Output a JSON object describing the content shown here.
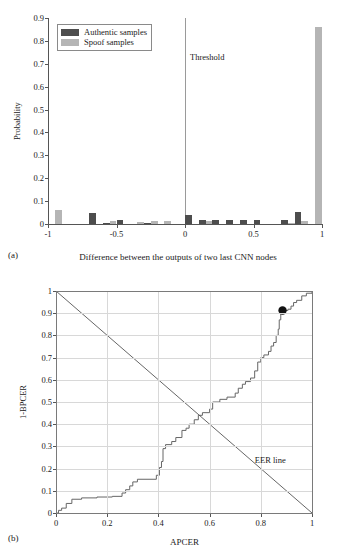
{
  "figure": {
    "panel_a_caption": "(a)",
    "panel_b_caption": "(b)"
  },
  "chart_data": [
    {
      "id": "panel-a",
      "type": "bar",
      "title": "",
      "xlabel": "Difference between the outputs of two last CNN nodes",
      "ylabel": "Probability",
      "xlim": [
        -1,
        1
      ],
      "ylim": [
        0,
        0.9
      ],
      "grid": false,
      "legend_position": "upper-left",
      "xticks": [
        "-1",
        "-0.5",
        "0",
        "0.5",
        "1"
      ],
      "xtick_values": [
        -1,
        -0.5,
        0,
        0.5,
        1
      ],
      "yticks": [
        "0",
        "0.1",
        "0.2",
        "0.3",
        "0.4",
        "0.5",
        "0.6",
        "0.7",
        "0.8",
        "0.9"
      ],
      "ytick_values": [
        0,
        0.1,
        0.2,
        0.3,
        0.4,
        0.5,
        0.6,
        0.7,
        0.8,
        0.9
      ],
      "bin_edges": [
        -1,
        -0.9,
        -0.8,
        -0.7,
        -0.6,
        -0.5,
        -0.4,
        -0.3,
        -0.2,
        -0.1,
        0,
        0.1,
        0.2,
        0.3,
        0.4,
        0.5,
        0.6,
        0.7,
        0.8,
        0.9,
        1
      ],
      "series": [
        {
          "name": "Authentic samples",
          "color": "#4d4d4d",
          "values": [
            0.0,
            0.0,
            0.0,
            0.05,
            0.005,
            0.018,
            0.0,
            0.004,
            0.0,
            0.0,
            0.038,
            0.018,
            0.016,
            0.016,
            0.016,
            0.016,
            0.0,
            0.018,
            0.052,
            0.0
          ]
        },
        {
          "name": "Spoof samples",
          "color": "#b5b5b5",
          "values": [
            0.061,
            0.0,
            0.0,
            0.0,
            0.012,
            0.0,
            0.008,
            0.011,
            0.012,
            0.0,
            0.0,
            0.012,
            0.0,
            0.0,
            0.0,
            0.0,
            0.0,
            0.006,
            0.011,
            0.86
          ]
        }
      ],
      "annotations": [
        {
          "name": "threshold",
          "label": "Threshold",
          "x": 0.0
        }
      ]
    },
    {
      "id": "panel-b",
      "type": "line",
      "title": "",
      "xlabel": "APCER",
      "ylabel": "1-BPCER",
      "xlim": [
        0,
        1
      ],
      "ylim": [
        0,
        1
      ],
      "grid": true,
      "legend_position": "none",
      "xticks": [
        "0",
        "0.2",
        "0.4",
        "0.6",
        "0.8",
        "1"
      ],
      "xtick_values": [
        0,
        0.2,
        0.4,
        0.6,
        0.8,
        1
      ],
      "yticks": [
        "0",
        "0.1",
        "0.2",
        "0.3",
        "0.4",
        "0.5",
        "0.6",
        "0.7",
        "0.8",
        "0.9",
        "1"
      ],
      "ytick_values": [
        0,
        0.1,
        0.2,
        0.3,
        0.4,
        0.5,
        0.6,
        0.7,
        0.8,
        0.9,
        1
      ],
      "series": [
        {
          "name": "ROC curve",
          "color": "#666666",
          "step": true,
          "points": [
            [
              0.0,
              0.0
            ],
            [
              0.01,
              0.0
            ],
            [
              0.01,
              0.012
            ],
            [
              0.022,
              0.012
            ],
            [
              0.022,
              0.022
            ],
            [
              0.04,
              0.022
            ],
            [
              0.04,
              0.043
            ],
            [
              0.062,
              0.043
            ],
            [
              0.062,
              0.062
            ],
            [
              0.1,
              0.062
            ],
            [
              0.1,
              0.068
            ],
            [
              0.16,
              0.068
            ],
            [
              0.16,
              0.072
            ],
            [
              0.22,
              0.072
            ],
            [
              0.22,
              0.075
            ],
            [
              0.258,
              0.075
            ],
            [
              0.258,
              0.09
            ],
            [
              0.272,
              0.09
            ],
            [
              0.272,
              0.105
            ],
            [
              0.288,
              0.105
            ],
            [
              0.288,
              0.122
            ],
            [
              0.3,
              0.122
            ],
            [
              0.3,
              0.14
            ],
            [
              0.318,
              0.14
            ],
            [
              0.318,
              0.152
            ],
            [
              0.392,
              0.152
            ],
            [
              0.392,
              0.17
            ],
            [
              0.404,
              0.17
            ],
            [
              0.404,
              0.205
            ],
            [
              0.412,
              0.205
            ],
            [
              0.412,
              0.232
            ],
            [
              0.418,
              0.232
            ],
            [
              0.418,
              0.29
            ],
            [
              0.428,
              0.29
            ],
            [
              0.428,
              0.308
            ],
            [
              0.452,
              0.308
            ],
            [
              0.452,
              0.322
            ],
            [
              0.468,
              0.322
            ],
            [
              0.468,
              0.34
            ],
            [
              0.492,
              0.34
            ],
            [
              0.492,
              0.372
            ],
            [
              0.508,
              0.372
            ],
            [
              0.508,
              0.382
            ],
            [
              0.52,
              0.382
            ],
            [
              0.52,
              0.4
            ],
            [
              0.54,
              0.4
            ],
            [
              0.54,
              0.42
            ],
            [
              0.556,
              0.42
            ],
            [
              0.556,
              0.44
            ],
            [
              0.572,
              0.44
            ],
            [
              0.572,
              0.452
            ],
            [
              0.6,
              0.452
            ],
            [
              0.6,
              0.468
            ],
            [
              0.612,
              0.468
            ],
            [
              0.612,
              0.5
            ],
            [
              0.64,
              0.5
            ],
            [
              0.64,
              0.512
            ],
            [
              0.668,
              0.512
            ],
            [
              0.668,
              0.522
            ],
            [
              0.7,
              0.522
            ],
            [
              0.7,
              0.54
            ],
            [
              0.712,
              0.54
            ],
            [
              0.712,
              0.562
            ],
            [
              0.728,
              0.562
            ],
            [
              0.728,
              0.58
            ],
            [
              0.74,
              0.58
            ],
            [
              0.74,
              0.592
            ],
            [
              0.76,
              0.592
            ],
            [
              0.76,
              0.608
            ],
            [
              0.776,
              0.608
            ],
            [
              0.776,
              0.64
            ],
            [
              0.788,
              0.64
            ],
            [
              0.788,
              0.68
            ],
            [
              0.8,
              0.68
            ],
            [
              0.8,
              0.7
            ],
            [
              0.812,
              0.7
            ],
            [
              0.812,
              0.712
            ],
            [
              0.83,
              0.712
            ],
            [
              0.83,
              0.728
            ],
            [
              0.84,
              0.728
            ],
            [
              0.84,
              0.752
            ],
            [
              0.85,
              0.752
            ],
            [
              0.85,
              0.768
            ],
            [
              0.86,
              0.768
            ],
            [
              0.86,
              0.8
            ],
            [
              0.868,
              0.8
            ],
            [
              0.868,
              0.828
            ],
            [
              0.872,
              0.828
            ],
            [
              0.872,
              0.87
            ],
            [
              0.878,
              0.87
            ],
            [
              0.878,
              0.9
            ],
            [
              0.89,
              0.9
            ],
            [
              0.89,
              0.912
            ],
            [
              0.906,
              0.912
            ],
            [
              0.906,
              0.918
            ],
            [
              0.918,
              0.918
            ],
            [
              0.918,
              0.932
            ],
            [
              0.928,
              0.932
            ],
            [
              0.928,
              0.948
            ],
            [
              0.94,
              0.948
            ],
            [
              0.94,
              0.958
            ],
            [
              0.96,
              0.958
            ],
            [
              0.96,
              0.978
            ],
            [
              0.978,
              0.978
            ],
            [
              0.978,
              0.99
            ],
            [
              1.0,
              0.99
            ],
            [
              1.0,
              1.0
            ]
          ]
        },
        {
          "name": "EER line",
          "color": "#555555",
          "step": false,
          "points": [
            [
              0.0,
              1.0
            ],
            [
              1.0,
              0.0
            ]
          ]
        }
      ],
      "markers": [
        {
          "name": "operating-point",
          "x": 0.885,
          "y": 0.912,
          "color": "#111111",
          "radius": 4.2
        }
      ],
      "annotations": [
        {
          "name": "eer-line-label",
          "label": "EER line",
          "x": 0.8,
          "y": 0.24
        }
      ]
    }
  ]
}
